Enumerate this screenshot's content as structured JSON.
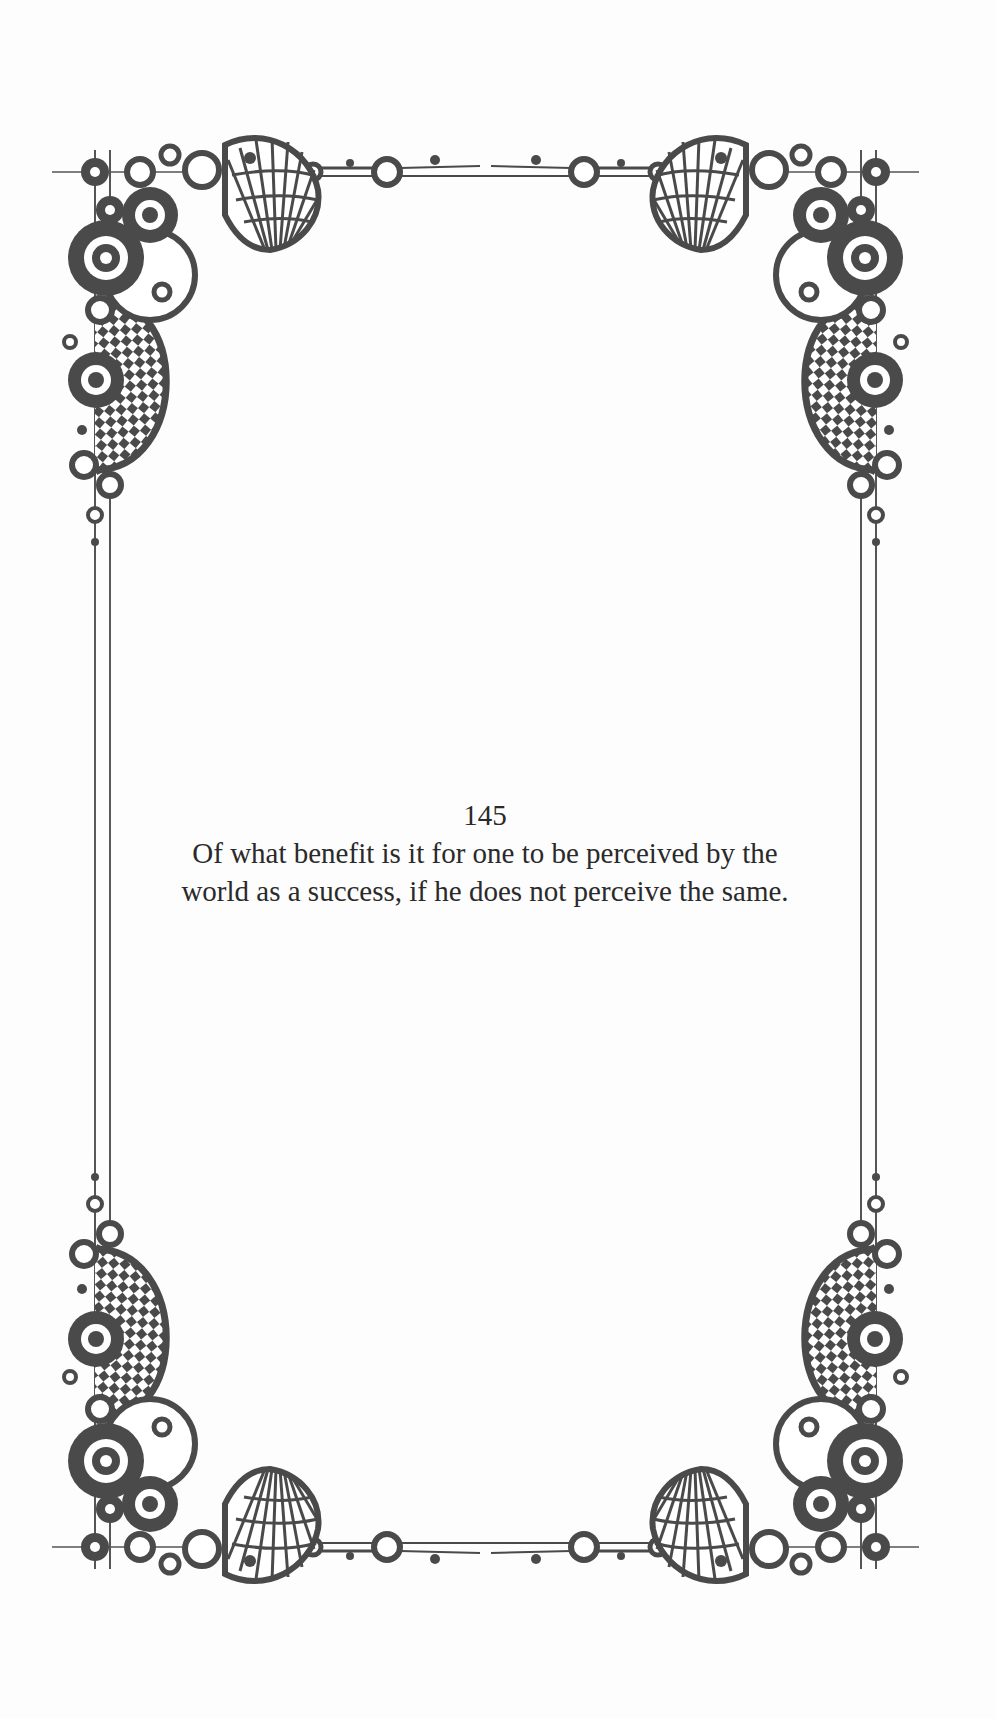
{
  "page": {
    "number": "145",
    "lines": [
      "Of what benefit is it for one to be perceived by the",
      "world as a success, if he does not perceive the same."
    ]
  },
  "decoration": {
    "style": "ornamental-border",
    "corners": [
      "top-left",
      "top-right",
      "bottom-left",
      "bottom-right"
    ],
    "ink_color": "#4a4a4a"
  }
}
